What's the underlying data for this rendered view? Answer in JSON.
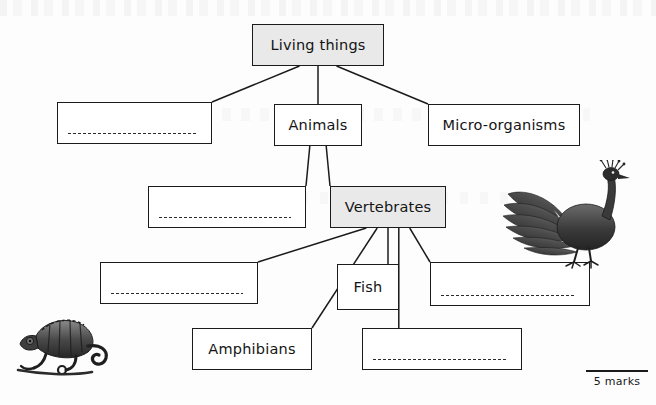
{
  "page": {
    "marks_label": "5 marks"
  },
  "diagram": {
    "type": "tree",
    "root": "Living things",
    "nodes": [
      {
        "id": "living-things",
        "label": "Living things",
        "style": "filled",
        "x": 252,
        "y": 24,
        "w": 132,
        "h": 42
      },
      {
        "id": "blank-1",
        "label": "",
        "style": "blank",
        "x": 57,
        "y": 102,
        "w": 155,
        "h": 42
      },
      {
        "id": "animals",
        "label": "Animals",
        "style": "plain",
        "x": 274,
        "y": 104,
        "w": 88,
        "h": 42
      },
      {
        "id": "micro-organisms",
        "label": "Micro-organisms",
        "style": "plain",
        "x": 428,
        "y": 104,
        "w": 152,
        "h": 42
      },
      {
        "id": "blank-2",
        "label": "",
        "style": "blank",
        "x": 148,
        "y": 186,
        "w": 158,
        "h": 42
      },
      {
        "id": "vertebrates",
        "label": "Vertebrates",
        "style": "filled",
        "x": 330,
        "y": 186,
        "w": 116,
        "h": 42
      },
      {
        "id": "blank-3",
        "label": "",
        "style": "blank",
        "x": 100,
        "y": 262,
        "w": 158,
        "h": 42
      },
      {
        "id": "fish",
        "label": "Fish",
        "style": "plain",
        "x": 337,
        "y": 264,
        "w": 62,
        "h": 46
      },
      {
        "id": "blank-4",
        "label": "",
        "style": "blank",
        "x": 430,
        "y": 262,
        "w": 160,
        "h": 44
      },
      {
        "id": "amphibians",
        "label": "Amphibians",
        "style": "plain",
        "x": 192,
        "y": 328,
        "w": 120,
        "h": 42
      },
      {
        "id": "blank-5",
        "label": "",
        "style": "blank",
        "x": 362,
        "y": 328,
        "w": 160,
        "h": 42
      }
    ],
    "edges": [
      {
        "from": "living-things",
        "to": "blank-1"
      },
      {
        "from": "living-things",
        "to": "animals"
      },
      {
        "from": "living-things",
        "to": "micro-organisms"
      },
      {
        "from": "animals",
        "to": "blank-2"
      },
      {
        "from": "animals",
        "to": "vertebrates"
      },
      {
        "from": "vertebrates",
        "to": "blank-3"
      },
      {
        "from": "vertebrates",
        "to": "amphibians"
      },
      {
        "from": "vertebrates",
        "to": "fish"
      },
      {
        "from": "vertebrates",
        "to": "blank-5"
      },
      {
        "from": "vertebrates",
        "to": "blank-4"
      }
    ]
  },
  "illustrations": [
    {
      "id": "peacock-illustration",
      "name": "peacock",
      "x": 494,
      "y": 160,
      "w": 150,
      "h": 116
    },
    {
      "id": "chameleon-illustration",
      "name": "chameleon",
      "x": 14,
      "y": 300,
      "w": 100,
      "h": 78
    }
  ],
  "colors": {
    "ink": "#1b1b1b",
    "box_fill_shaded": "#e9e9e9",
    "box_fill_plain": "#ffffff",
    "page_background": "#fdfdfd"
  }
}
